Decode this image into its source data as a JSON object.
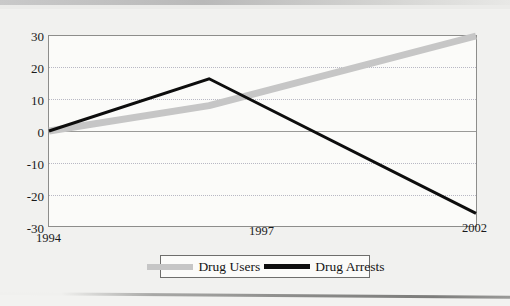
{
  "chart_data": {
    "type": "line",
    "title": "",
    "xlabel": "",
    "ylabel": "",
    "categories": [
      "1994",
      "1997",
      "2002"
    ],
    "x": [
      1994,
      1997,
      2002
    ],
    "xlim": [
      1994,
      2002
    ],
    "ylim": [
      -30,
      30
    ],
    "yticks": [
      30,
      20,
      10,
      0,
      -10,
      -20,
      -30
    ],
    "xticks": [
      "1994",
      "1997",
      "2002"
    ],
    "grid": true,
    "legend_position": "bottom",
    "series": [
      {
        "name": "Drug Users",
        "color": "#c6c6c6",
        "line_width": 7,
        "values": [
          0,
          8,
          30
        ]
      },
      {
        "name": "Drug Arrests",
        "color": "#0d0d0d",
        "line_width": 3,
        "values": [
          0,
          16.5,
          -26
        ]
      }
    ]
  },
  "axis": {
    "y_labels": [
      "30",
      "20",
      "10",
      "0",
      "-10",
      "-20",
      "-30"
    ],
    "x_labels": [
      "1994",
      "1997",
      "2002"
    ]
  },
  "legend": {
    "items": [
      {
        "label": "Drug Users",
        "swatch": "thick-gray-line-swatch"
      },
      {
        "label": "Drug Arrests",
        "swatch": "thin-black-line-swatch"
      }
    ]
  },
  "colors": {
    "page_background": "#f1f1ef",
    "plot_background": "#fbfbf9",
    "frame": "#8d8d8b",
    "gridline": "#b8b8c4",
    "zero_line": "#9a9a98",
    "drug_users": "#c6c6c6",
    "drug_arrests": "#0d0d0d"
  }
}
